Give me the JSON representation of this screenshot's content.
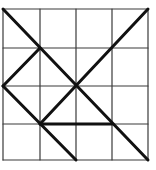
{
  "diagram": {
    "type": "grid-with-line-segments",
    "grid": {
      "columns": 4,
      "rows": 4,
      "x_lines": [
        3,
        40,
        76,
        112,
        148
      ],
      "y_lines": [
        9,
        48,
        86,
        124,
        160
      ],
      "line_color": "#3a3a3a",
      "line_width": 1.2
    },
    "segments_color": "#111111",
    "segments_width": 3,
    "segments": [
      {
        "id": "diag-main",
        "from": [
          0,
          0
        ],
        "to": [
          4,
          4
        ]
      },
      {
        "id": "diag-anti",
        "from": [
          4,
          0
        ],
        "to": [
          1,
          3
        ]
      },
      {
        "id": "short-upper-left",
        "from": [
          1,
          1
        ],
        "to": [
          0,
          2
        ]
      },
      {
        "id": "lower-left-diag",
        "from": [
          0,
          2
        ],
        "to": [
          2,
          4
        ]
      },
      {
        "id": "horizontal",
        "from": [
          1,
          3
        ],
        "to": [
          3,
          3
        ]
      }
    ]
  }
}
